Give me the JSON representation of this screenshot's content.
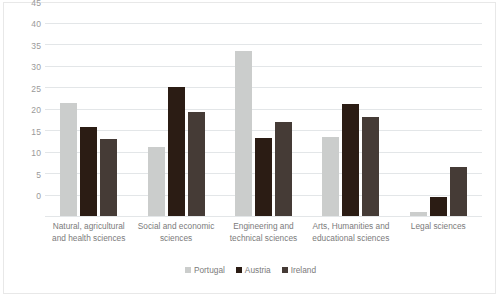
{
  "chart_data": {
    "type": "bar",
    "title": "",
    "xlabel": "",
    "ylabel": "",
    "ylim": [
      0,
      45
    ],
    "ytick_step": 5,
    "yticks": [
      "45",
      "40",
      "35",
      "30",
      "25",
      "20",
      "15",
      "10",
      "5",
      "0"
    ],
    "grid": true,
    "legend_position": "bottom",
    "categories": [
      "Natural, agricultural and health sciences",
      "Social and economic sciences",
      "Engineering and technical sciences",
      "Arts, Humanities and educational sciences",
      "Legal sciences"
    ],
    "series": [
      {
        "name": "Portugal",
        "color": "#cbcdcc",
        "values": [
          26.3,
          16.0,
          38.5,
          18.5,
          1.0
        ]
      },
      {
        "name": "Austria",
        "color": "#2b1c14",
        "values": [
          20.8,
          30.0,
          18.3,
          26.2,
          4.5
        ]
      },
      {
        "name": "Ireland",
        "color": "#453b36",
        "values": [
          18.0,
          24.3,
          22.0,
          23.2,
          11.5
        ]
      }
    ]
  },
  "colors": {
    "gridline": "#e3e6e8",
    "frame_border": "#e8e8e8",
    "tick_text": "#9a9a9a",
    "label_text": "#7b7b7b",
    "background": "#ffffff"
  }
}
